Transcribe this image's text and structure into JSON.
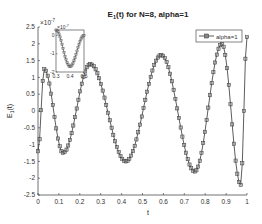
{
  "chart_data": {
    "type": "line",
    "title": "E1(t) for N=8, alpha=1",
    "title_main": "E",
    "title_sub": "1",
    "title_rest": "(t) for N=8, alpha=1",
    "xlabel": "t",
    "ylabel": "E1(t)",
    "ylabel_main": "E",
    "ylabel_sub": "1",
    "ylabel_rest": "(t)",
    "y_exponent": "x10^-7",
    "y_exponent_base": "×10",
    "y_exponent_power": "-7",
    "xlim": [
      0,
      1
    ],
    "ylim": [
      -2.5,
      2.5
    ],
    "xticks": [
      "0",
      "0.1",
      "0.2",
      "0.3",
      "0.4",
      "0.5",
      "0.6",
      "0.7",
      "0.8",
      "0.9",
      "1"
    ],
    "yticks": [
      "2.5",
      "2",
      "1.5",
      "1",
      "0.5",
      "0",
      "-0.5",
      "-1",
      "-1.5",
      "-2",
      "-2.5"
    ],
    "grid": false,
    "legend_position": "northeast",
    "series": [
      {
        "name": "alpha=1",
        "marker": "square",
        "color": "#333333",
        "x": [
          0,
          0.03,
          0.12,
          0.25,
          0.42,
          0.59,
          0.75,
          0.88,
          0.97,
          1.0
        ],
        "values": [
          -1.2,
          1.25,
          -1.25,
          1.4,
          -1.5,
          1.67,
          -1.8,
          2.0,
          -2.2,
          2.2
        ]
      }
    ],
    "inset": {
      "xlim": [
        0.3,
        0.5
      ],
      "ylim": [
        -2,
        0.3
      ],
      "xticks": [
        "0.3",
        "0.4",
        "0.5"
      ],
      "yticks": [
        "0",
        "-1",
        "-2"
      ],
      "y_exponent_base": "×10",
      "y_exponent_power": "-7",
      "x": [
        0.3,
        0.4,
        0.5
      ],
      "values": [
        0.3,
        -1.7,
        0.0
      ]
    }
  }
}
